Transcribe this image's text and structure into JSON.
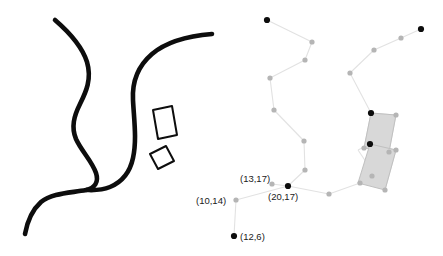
{
  "figure": {
    "background_color": "#ffffff",
    "width": 443,
    "height": 256,
    "panels": [
      {
        "name": "left-panel-road-sketch",
        "description": "Hand-drawn thick black road curves with two outlined rectangles"
      },
      {
        "name": "right-panel-graph",
        "description": "Light gray node-and-edge graph with two shaded rectangles and coordinate labels"
      }
    ]
  },
  "colors": {
    "stroke_black": "#0d0d0d",
    "edge_gray": "#e2e2e2",
    "node_gray": "#b5b5b5",
    "node_black": "#0d0d0d",
    "rect_fill": "#d8d8d8",
    "rect_stroke": "#c0c0c0",
    "label_text": "#1a1a1a"
  },
  "left_panel": {
    "curves": [
      {
        "name": "road-curve-west",
        "path": "M 55 20 C 70 33, 82 46, 87 62 C 92 79, 86 92, 80 104 C 74 116, 71 127, 76 139 C 82 152, 92 161, 96 173 C 99 182, 95 188, 86 190 C 70 193, 52 193, 41 202 C 31 211, 27 223, 25 234"
      },
      {
        "name": "road-curve-east",
        "path": "M 212 34 C 188 36, 166 42, 152 54 C 138 66, 132 82, 133 100 C 134 120, 137 140, 133 158 C 130 172, 122 182, 110 187 C 100 191, 92 190, 86 190"
      }
    ],
    "rectangles": [
      {
        "name": "outlined-rect-upper",
        "points": "153,110 172,106 177,135 158,139"
      },
      {
        "name": "outlined-rect-lower",
        "points": "150,154 166,146 174,161 158,169"
      }
    ]
  },
  "right_panel": {
    "edges": [
      "267,20 312,42",
      "312,42 305,60",
      "305,60 270,78",
      "270,78 274,110",
      "274,110 304,141",
      "304,141 305,170",
      "305,170 288,186",
      "288,186 329,194",
      "329,194 360,183",
      "360,183 372,176",
      "372,176 385,190",
      "385,190 372,176",
      "372,176 370,144",
      "370,144 358,150",
      "358,150 385,190",
      "370,144 396,150",
      "396,150 385,190",
      "371,113 364,148",
      "364,148 389,152",
      "389,152 396,115",
      "396,115 371,113",
      "371,113 350,73",
      "350,73 374,50",
      "374,50 401,38",
      "401,38 421,29",
      "288,186 236,200",
      "236,200 234,236",
      "288,186 272,184"
    ],
    "gray_nodes": [
      "312,42",
      "305,60",
      "270,78",
      "274,110",
      "304,141",
      "305,170",
      "329,194",
      "360,183",
      "236,200",
      "272,184",
      "350,73",
      "374,50",
      "401,38",
      "364,148",
      "389,152",
      "396,115",
      "372,176",
      "385,190",
      "396,150"
    ],
    "black_nodes": [
      "267,20",
      "421,29",
      "288,186",
      "234,236",
      "371,113",
      "370,144"
    ],
    "shaded_rectangles": [
      {
        "name": "shaded-rect-upper",
        "points": "371,113 396,115 389,152 364,148"
      },
      {
        "name": "shaded-rect-lower",
        "points": "370,144 396,150 385,190 358,183"
      }
    ],
    "labels": [
      {
        "name": "coord-label-13-17",
        "text": "(13,17)",
        "x": 240,
        "y": 182,
        "anchor": "start"
      },
      {
        "name": "coord-label-10-14",
        "text": "(10,14)",
        "x": 196,
        "y": 204,
        "anchor": "start"
      },
      {
        "name": "coord-label-20-17",
        "text": "(20,17)",
        "x": 268,
        "y": 200,
        "anchor": "start"
      },
      {
        "name": "coord-label-12-6",
        "text": "(12,6)",
        "x": 240,
        "y": 240,
        "anchor": "start"
      }
    ]
  }
}
